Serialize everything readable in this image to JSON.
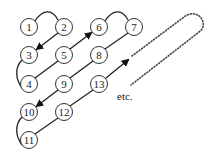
{
  "diagram": {
    "nodes": [
      {
        "id": 1,
        "label": "1",
        "x": 29,
        "y": 27
      },
      {
        "id": 2,
        "label": "2",
        "x": 64,
        "y": 27
      },
      {
        "id": 3,
        "label": "3",
        "x": 29,
        "y": 55
      },
      {
        "id": 4,
        "label": "4",
        "x": 29,
        "y": 84
      },
      {
        "id": 5,
        "label": "5",
        "x": 64,
        "y": 55
      },
      {
        "id": 6,
        "label": "6",
        "x": 99,
        "y": 27
      },
      {
        "id": 7,
        "label": "7",
        "x": 134,
        "y": 27
      },
      {
        "id": 8,
        "label": "8",
        "x": 99,
        "y": 55
      },
      {
        "id": 9,
        "label": "9",
        "x": 64,
        "y": 84
      },
      {
        "id": 10,
        "label": "10",
        "x": 29,
        "y": 112
      },
      {
        "id": 11,
        "label": "11",
        "x": 29,
        "y": 140
      },
      {
        "id": 12,
        "label": "12",
        "x": 64,
        "y": 112
      },
      {
        "id": 13,
        "label": "13",
        "x": 99,
        "y": 84
      }
    ],
    "edges": [
      {
        "from": 1,
        "to": 2,
        "style": "arc"
      },
      {
        "from": 2,
        "to": 3,
        "style": "arrow"
      },
      {
        "from": 3,
        "to": 4,
        "style": "arc"
      },
      {
        "from": 4,
        "to": 6,
        "style": "arrow"
      },
      {
        "from": 6,
        "to": 7,
        "style": "arc"
      },
      {
        "from": 7,
        "to": 10,
        "style": "arrow"
      },
      {
        "from": 10,
        "to": 11,
        "style": "arc"
      },
      {
        "from": 11,
        "to": 13,
        "style": "arrow"
      },
      {
        "from": 13,
        "to": "continuation",
        "style": "dotted-loop"
      }
    ],
    "continuation_label": "etc.",
    "colors": {
      "stroke": "#222222",
      "fill": "#ffffff"
    }
  }
}
